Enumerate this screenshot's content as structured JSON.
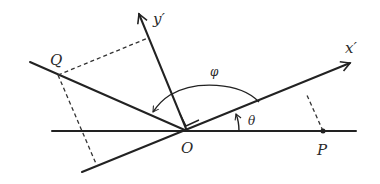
{
  "figure": {
    "type": "coordinate-rotation-diagram",
    "labels": {
      "origin": "O",
      "point_p": "P",
      "point_q": "Q",
      "x_prime_axis": "x′",
      "y_prime_axis": "y′",
      "angle_theta": "θ",
      "angle_phi": "φ"
    },
    "colors": {
      "ink": "#222222",
      "background": "#ffffff"
    },
    "geometry": {
      "origin": [
        187,
        131
      ],
      "horizontal_axis": {
        "from": [
          52,
          131
        ],
        "to": [
          356,
          131
        ]
      },
      "x_prime_axis": {
        "from": [
          82,
          172
        ],
        "to": [
          350,
          63
        ]
      },
      "y_prime_axis": {
        "from": [
          187,
          131
        ],
        "to": [
          139,
          14
        ]
      },
      "line_oq": {
        "from": [
          30,
          62
        ],
        "to": [
          187,
          131
        ]
      },
      "point_p": [
        323,
        131
      ],
      "point_q": [
        58,
        75
      ]
    }
  }
}
